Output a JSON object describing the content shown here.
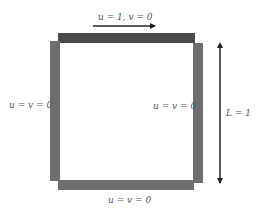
{
  "diagram": {
    "labels": {
      "top": "u = 1, v = 0",
      "left": "u = v = 0",
      "right": "u = v = 0",
      "bottom": "u = v = 0",
      "length": "L = 1"
    },
    "colors": {
      "lid": "#4a4a4a",
      "walls": "#6e6e6e",
      "arrow": "#222222",
      "text": "#555555"
    }
  }
}
